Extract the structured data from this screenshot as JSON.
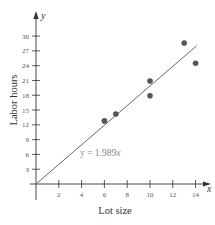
{
  "chart_data": {
    "type": "scatter",
    "title": "",
    "xlabel": "Lot size",
    "ylabel": "Labor hours",
    "x_axis_var": "x",
    "y_axis_var": "y",
    "xlim": [
      0,
      15
    ],
    "ylim": [
      0,
      33
    ],
    "x_ticks": [
      2,
      4,
      6,
      8,
      10,
      12,
      14
    ],
    "y_ticks": [
      3,
      6,
      9,
      12,
      15,
      18,
      21,
      24,
      27,
      30
    ],
    "grid": false,
    "legend": null,
    "series": [
      {
        "name": "observations",
        "type": "scatter",
        "color": "#555555",
        "points": [
          {
            "x": 6,
            "y": 12.8
          },
          {
            "x": 7,
            "y": 14.2
          },
          {
            "x": 10,
            "y": 17.9
          },
          {
            "x": 10,
            "y": 20.9
          },
          {
            "x": 13,
            "y": 28.6
          },
          {
            "x": 14,
            "y": 24.5
          }
        ]
      },
      {
        "name": "regression line",
        "type": "line",
        "color": "#666666",
        "slope": 1.989,
        "intercept": 0,
        "x_range": [
          0,
          14.1
        ]
      }
    ],
    "annotations": [
      {
        "text": "y = 1.989x",
        "x": 3.8,
        "y": 6.3
      }
    ]
  },
  "labels": {
    "x_axis": "Lot size",
    "y_axis": "Labor hours",
    "x_var": "x",
    "y_var": "y",
    "equation_prefix": "y = 1.989",
    "equation_var": "x"
  },
  "style": {
    "axis_color": "#333333",
    "point_color": "#555555",
    "line_color": "#666666"
  }
}
